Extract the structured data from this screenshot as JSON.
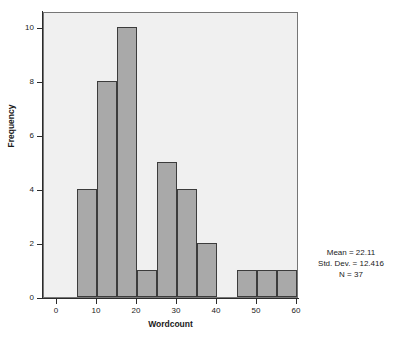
{
  "chart_data": {
    "type": "bar",
    "title": "",
    "subtitle": "",
    "xlabel": "Wordcount",
    "ylabel": "Frequency",
    "xlim": [
      -2.5,
      63.5
    ],
    "ylim": [
      0,
      10.6
    ],
    "grid": false,
    "legend": null,
    "bin_width": 5,
    "bin_starts": [
      5,
      10,
      15,
      20,
      25,
      30,
      35,
      40,
      45,
      50,
      55
    ],
    "categories": [
      "5-10",
      "10-15",
      "15-20",
      "20-25",
      "25-30",
      "30-35",
      "35-40",
      "40-45",
      "45-50",
      "50-55",
      "55-60"
    ],
    "values": [
      4,
      8,
      10,
      1,
      5,
      4,
      2,
      0,
      1,
      1,
      1
    ],
    "xticks": [
      0,
      10,
      20,
      30,
      40,
      50,
      60
    ],
    "xtick_labels": [
      "0",
      "10",
      "20",
      "30",
      "40",
      "50",
      "60"
    ],
    "yticks": [
      0,
      2,
      4,
      6,
      8,
      10
    ],
    "ytick_labels": [
      "0",
      "2",
      "4",
      "6",
      "8",
      "10"
    ],
    "bar_fill_color": "#a9a9a9",
    "bar_edge_color": "#3c3c3c",
    "plot_background_color": "#f0f0f0",
    "figure_background_color": "#ffffff",
    "annotations": {
      "mean": "Mean = 22.11",
      "std_dev": "Std. Dev. = 12.416",
      "n": "N = 37"
    }
  }
}
